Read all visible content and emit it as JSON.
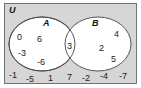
{
  "diagram": {
    "type": "venn",
    "universal_label": "U",
    "colors": {
      "universe_fill": "#d6d6d6",
      "set_fill": "#ffffff",
      "stroke": "#444444"
    },
    "sets": [
      {
        "label": "A",
        "only_elements": [
          "0",
          "6",
          "-3",
          "-6"
        ]
      },
      {
        "label": "B",
        "only_elements": [
          "4",
          "2",
          "5"
        ]
      }
    ],
    "intersection": [
      "3"
    ],
    "outside": [
      "-1",
      "-5",
      "1",
      "7",
      "-2",
      "-4",
      "-7"
    ]
  }
}
